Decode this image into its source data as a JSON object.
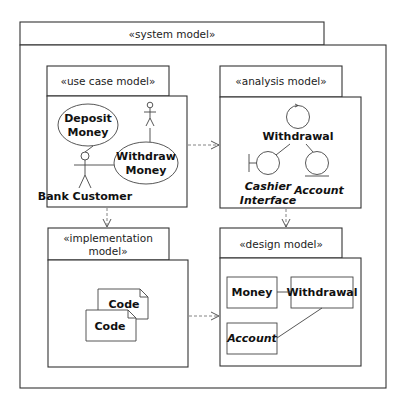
{
  "system_model": {
    "stereotype": "«system model»"
  },
  "use_case_model": {
    "stereotype": "«use case model»",
    "use_cases": [
      {
        "line1": "Deposit",
        "line2": "Money"
      },
      {
        "line1": "Withdraw",
        "line2": "Money"
      }
    ],
    "actors": [
      {
        "label": "Bank Customer"
      },
      {
        "label": ""
      }
    ]
  },
  "analysis_model": {
    "stereotype": "«analysis model»",
    "control": {
      "label": "Withdrawal"
    },
    "boundary": {
      "line1": "Cashier",
      "line2": "Interface"
    },
    "entity": {
      "label": "Account"
    }
  },
  "implementation_model": {
    "stereotype_line1": "«implementation",
    "stereotype_line2": "model»",
    "artifacts": [
      {
        "label": "Code"
      },
      {
        "label": "Code"
      }
    ]
  },
  "design_model": {
    "stereotype": "«design model»",
    "classes": [
      {
        "label": "Money"
      },
      {
        "label": "Withdrawal"
      },
      {
        "label": "Account"
      }
    ]
  }
}
